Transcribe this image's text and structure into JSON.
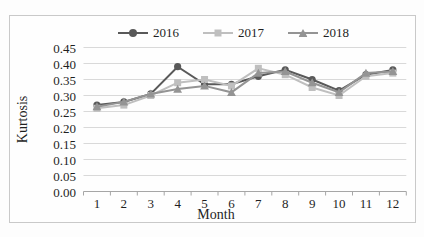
{
  "chart_data": {
    "type": "line",
    "title": "",
    "xlabel": "Month",
    "ylabel": "Kurtosis",
    "categories": [
      "1",
      "2",
      "3",
      "4",
      "5",
      "6",
      "7",
      "8",
      "9",
      "10",
      "11",
      "12"
    ],
    "yticks": [
      0.0,
      0.05,
      0.1,
      0.15,
      0.2,
      0.25,
      0.3,
      0.35,
      0.4,
      0.45
    ],
    "ylim": [
      0,
      0.45
    ],
    "grid": true,
    "legend_position": "top-center",
    "series": [
      {
        "name": "2016",
        "marker": "circle",
        "color": "#595959",
        "values": [
          0.27,
          0.28,
          0.305,
          0.39,
          0.335,
          0.335,
          0.36,
          0.38,
          0.35,
          0.315,
          0.365,
          0.38
        ]
      },
      {
        "name": "2017",
        "marker": "square",
        "color": "#bfbfbf",
        "values": [
          0.26,
          0.27,
          0.3,
          0.34,
          0.35,
          0.33,
          0.385,
          0.365,
          0.325,
          0.3,
          0.36,
          0.37
        ]
      },
      {
        "name": "2018",
        "marker": "triangle",
        "color": "#949494",
        "values": [
          0.265,
          0.28,
          0.305,
          0.32,
          0.33,
          0.31,
          0.37,
          0.375,
          0.34,
          0.31,
          0.37,
          0.375
        ]
      }
    ]
  },
  "colors": {
    "gridline": "#d9d9d9",
    "axis": "#a6a6a6",
    "frame_border": "#c9c9c9",
    "text": "#1f1f1f"
  }
}
